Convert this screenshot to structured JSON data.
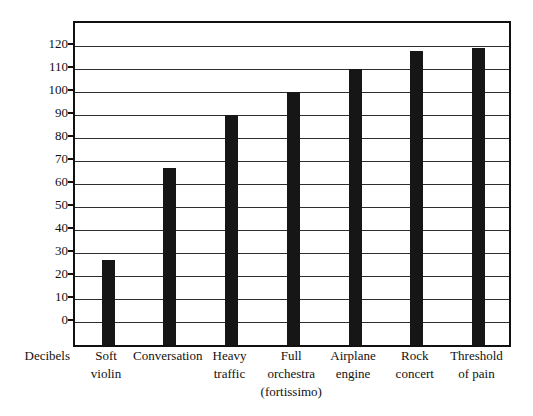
{
  "figure": {
    "background": "#ffffff"
  },
  "chart_data": {
    "type": "bar",
    "title": "",
    "xlabel": "",
    "ylabel": "Decibels",
    "categories": [
      "Soft\nviolin",
      "Conversation",
      "Heavy\ntraffic",
      "Full\norchestra\n(fortissimo)",
      "Airplane\nengine",
      "Rock\nconcert",
      "Threshold\nof pain"
    ],
    "values": [
      27,
      67,
      90,
      100,
      110,
      118,
      119
    ],
    "y_axis": {
      "min": 0,
      "max": 120,
      "step": 10,
      "ticks": [
        0,
        10,
        20,
        30,
        40,
        50,
        60,
        70,
        80,
        90,
        100,
        110,
        120
      ]
    },
    "ylim": [
      -10,
      130
    ],
    "grid": true,
    "legend": false,
    "colors": {
      "bar": "#161616",
      "gridline": "#2e2e2e",
      "frame": "#111111",
      "text": "#111111",
      "background": "#ffffff"
    }
  }
}
